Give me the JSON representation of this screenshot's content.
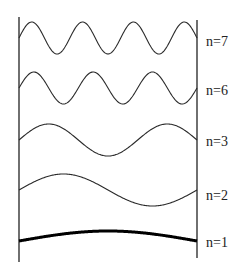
{
  "diagram": {
    "type": "standing-waves-on-string",
    "walls": {
      "left_x": 19,
      "right_x": 197,
      "left_top": 17,
      "left_bottom": 262,
      "right_top": 20,
      "right_bottom": 258
    },
    "modes": [
      {
        "id": "n7",
        "label": "n=7",
        "cycles": 3.5,
        "baseline_y": 38,
        "amplitude": 16,
        "thick": false,
        "label_y": 46
      },
      {
        "id": "n6",
        "label": "n=6",
        "cycles": 3.0,
        "baseline_y": 88,
        "amplitude": 16,
        "thick": false,
        "label_y": 95
      },
      {
        "id": "n3",
        "label": "n=3",
        "cycles": 1.5,
        "baseline_y": 140,
        "amplitude": 16,
        "thick": false,
        "label_y": 146
      },
      {
        "id": "n2",
        "label": "n=2",
        "cycles": 1.0,
        "baseline_y": 190,
        "amplitude": 16,
        "thick": false,
        "label_y": 200
      },
      {
        "id": "n1",
        "label": "n=1",
        "cycles": 0.5,
        "baseline_y": 241,
        "amplitude": 10,
        "thick": true,
        "label_y": 247
      }
    ],
    "colors": {
      "line": "#2a2a2a",
      "fundamental": "#000000",
      "background": "#ffffff"
    }
  }
}
